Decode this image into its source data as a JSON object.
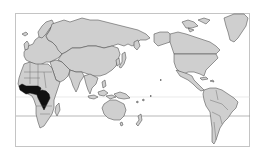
{
  "map": {
    "projection": "Pacific-centered world map",
    "colors": {
      "background": "#ffffff",
      "land": "#cfcfcf",
      "outline": "#4a4a4a",
      "highlight": "#111111",
      "frame": "#c4c4c4"
    },
    "highlighted_regions": [
      "West African coastal countries (Guinea to Cameroon)",
      "Democratic Republic of the Congo"
    ],
    "reference_lines": [
      "Equator (faint)",
      "Tropic of Capricorn"
    ]
  }
}
